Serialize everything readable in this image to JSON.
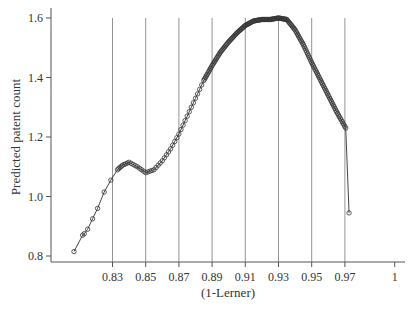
{
  "chart_data": {
    "type": "line",
    "title": "",
    "xlabel": "(1-Lerner)",
    "ylabel": "Predicted patent count",
    "xlim": [
      0.805,
      1.0
    ],
    "ylim": [
      0.79,
      1.62
    ],
    "grid": "vertical lines at x ticks 0.83–0.97",
    "legend": "none",
    "x_ticks": [
      "0.83",
      "0.85",
      "0.87",
      "0.89",
      "0.91",
      "0.93",
      "0.95",
      "0.97",
      "1"
    ],
    "x_tick_values": [
      0.83,
      0.85,
      0.87,
      0.89,
      0.91,
      0.93,
      0.95,
      0.97,
      1.0
    ],
    "y_ticks": [
      "0.8",
      "1.0",
      "1.2",
      "1.4",
      "1.6"
    ],
    "y_tick_values": [
      0.8,
      1.0,
      1.2,
      1.4,
      1.6
    ],
    "series": [
      {
        "name": "Predicted patent count",
        "marker": "open circle",
        "x": [
          0.8068,
          0.812,
          0.813,
          0.815,
          0.818,
          0.821,
          0.825,
          0.829,
          0.833,
          0.836,
          0.84,
          0.845,
          0.85,
          0.855,
          0.86,
          0.865,
          0.87,
          0.875,
          0.88,
          0.885,
          0.89,
          0.895,
          0.9,
          0.905,
          0.91,
          0.915,
          0.92,
          0.925,
          0.93,
          0.935,
          0.94,
          0.945,
          0.95,
          0.955,
          0.96,
          0.965,
          0.9705,
          0.9725
        ],
        "y": [
          0.815,
          0.87,
          0.875,
          0.89,
          0.925,
          0.96,
          1.015,
          1.055,
          1.09,
          1.105,
          1.115,
          1.1,
          1.08,
          1.09,
          1.12,
          1.16,
          1.21,
          1.27,
          1.33,
          1.39,
          1.44,
          1.485,
          1.52,
          1.55,
          1.575,
          1.59,
          1.595,
          1.595,
          1.6,
          1.595,
          1.56,
          1.51,
          1.45,
          1.395,
          1.34,
          1.285,
          1.23,
          0.945
        ]
      }
    ]
  },
  "plot": {
    "left": 51,
    "right": 405,
    "top": 8,
    "bottom": 262,
    "x_px_per_unit": 1660,
    "x_origin_val": 0.83,
    "x_origin_px": 112.5,
    "y_px_per_unit": 297.5,
    "y_origin_val": 0.8,
    "y_origin_px": 256,
    "colors": {
      "axis": "#555555",
      "grid": "#888888",
      "line": "#444444",
      "marker": "#333333"
    }
  }
}
